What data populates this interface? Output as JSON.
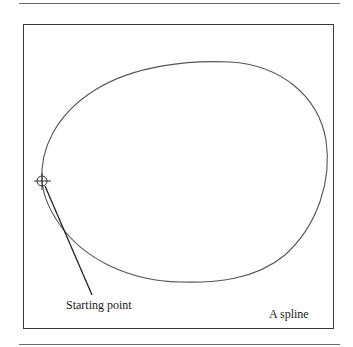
{
  "figure": {
    "labels": {
      "starting_point": "Starting point",
      "spline": "A spline"
    },
    "colors": {
      "curve": "#555555",
      "pointer": "#222222",
      "frame": "#3a3a3a",
      "rule": "#6a6a6a"
    },
    "marker": {
      "type": "crosshair-circle",
      "center": [
        42,
        181
      ],
      "radius": 5
    }
  }
}
